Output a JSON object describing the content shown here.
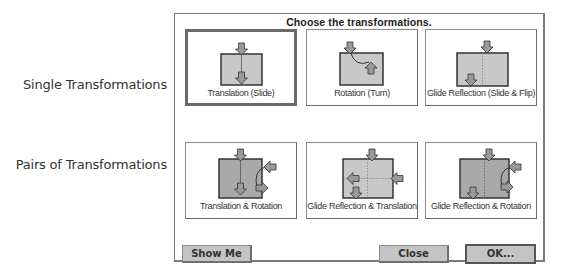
{
  "row_labels": {
    "single": "Single Transformations",
    "pairs": "Pairs of Transformations"
  },
  "dialog": {
    "title": "Choose the transformations.",
    "cards": [
      {
        "label": "Translation (Slide)",
        "icon": "translation-icon",
        "selected": true
      },
      {
        "label": "Rotation (Turn)",
        "icon": "rotation-icon",
        "selected": false
      },
      {
        "label": "Glide Reflection (Slide & Flip)",
        "icon": "glide-reflection-icon",
        "selected": false
      },
      {
        "label": "Translation & Rotation",
        "icon": "translation-rotation-icon",
        "selected": false
      },
      {
        "label": "Glide Reflection & Translation",
        "icon": "glide-reflection-translation-icon",
        "selected": false
      },
      {
        "label": "Glide Reflection & Rotation",
        "icon": "glide-reflection-rotation-icon",
        "selected": false
      }
    ],
    "buttons": {
      "show_me": "Show Me",
      "close": "Close",
      "ok": "OK..."
    }
  },
  "colors": {
    "shape_fill": "#c8c8c8",
    "shape_fill_dark": "#a9a9a9",
    "outline": "#333333",
    "button_face": "#c4c4c4"
  }
}
